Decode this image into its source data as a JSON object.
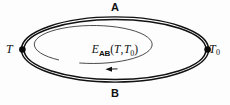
{
  "figure": {
    "background_color": "#fdfdfd",
    "stroke_color": "#111111",
    "width": 230,
    "height": 105
  },
  "labels": {
    "conductor_a": "A",
    "conductor_b": "B",
    "junction_hot": "T",
    "junction_cold_base": "T",
    "junction_cold_sub": "0",
    "emf_symbol": "E",
    "emf_subscript": "AB",
    "emf_open_paren": "(",
    "emf_arg1": "T",
    "emf_comma": ",",
    "emf_arg2": "T",
    "emf_arg2_sub": "0",
    "emf_close_paren": ")"
  },
  "geometry": {
    "outer_loop": {
      "shape": "ellipse-double-line",
      "cx": 115,
      "cy": 49.5,
      "rx": 93,
      "ry": 32,
      "gap": 2.6,
      "stroke_width": 1.5
    },
    "inner_loop": {
      "shape": "ellipse-open-arc",
      "cx": 115,
      "cy": 50,
      "rx": 59,
      "ry": 19,
      "stroke_width": 0.9,
      "gap_start_deg": 128,
      "gap_end_deg": 152
    },
    "junction_nodes": [
      {
        "name": "junction-node-t",
        "cx": 22,
        "cy": 49.5,
        "r": 3.2
      },
      {
        "name": "junction-node-t0",
        "cx": 208,
        "cy": 49.5,
        "r": 3.2
      }
    ],
    "current_arrow": {
      "name": "emf-direction-arrow",
      "x": 108,
      "y": 69.2,
      "direction": "left",
      "length": 9
    }
  }
}
